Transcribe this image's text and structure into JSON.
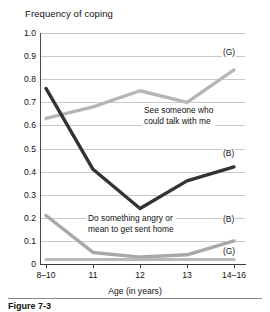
{
  "chart_data": {
    "type": "line",
    "title": "Frequency of coping",
    "xlabel": "Age (in years)",
    "ylabel": "",
    "categories": [
      "8–10",
      "11",
      "12",
      "13",
      "14–16"
    ],
    "ylim": [
      0,
      1.0
    ],
    "ytick_labels": [
      "0",
      "0.1",
      "0.2",
      "0.3",
      "0.4",
      "0.5",
      "0.6",
      "0.7",
      "0.8",
      "0.9",
      "1.0"
    ],
    "ytick_values": [
      0,
      0.1,
      0.2,
      0.3,
      0.4,
      0.5,
      0.6,
      0.7,
      0.8,
      0.9,
      1.0
    ],
    "grid": true,
    "legend_position": "inline-end-labels",
    "series": [
      {
        "name": "See someone who could talk with me (G)",
        "short_label": "(G)",
        "color": "#b6b6b6",
        "values": [
          0.63,
          0.68,
          0.75,
          0.7,
          0.84
        ]
      },
      {
        "name": "See someone who could talk with me (B)",
        "short_label": "(B)",
        "color": "#333333",
        "values": [
          0.76,
          0.41,
          0.24,
          0.36,
          0.42
        ]
      },
      {
        "name": "Do something angry or mean to get sent home (B)",
        "short_label": "(B)",
        "color": "#a8a8a8",
        "values": [
          0.21,
          0.05,
          0.03,
          0.04,
          0.1
        ]
      },
      {
        "name": "Do something angry or mean to get sent home (G)",
        "short_label": "(G)",
        "color": "#b9b9b9",
        "values": [
          0.02,
          0.02,
          0.02,
          0.02,
          0.02
        ]
      }
    ],
    "annotations": [
      {
        "id": "talk",
        "line1": "See someone who",
        "line2": "could talk with me"
      },
      {
        "id": "angry",
        "line1": "Do something angry or",
        "line2": "mean to get sent home"
      }
    ],
    "end_labels": {
      "g_top": "(G)",
      "b_top": "(B)",
      "b_bottom": "(B)",
      "g_bottom": "(G)"
    }
  },
  "caption": {
    "text": "Figure 7-3"
  }
}
